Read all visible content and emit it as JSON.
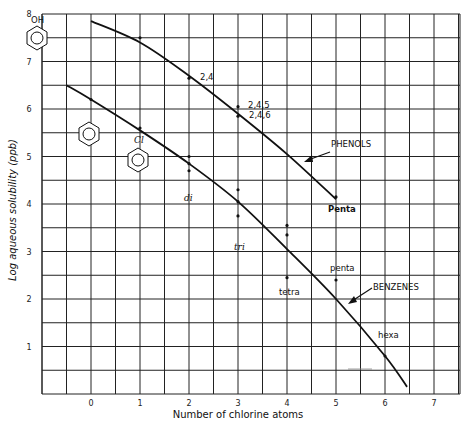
{
  "chart_data": {
    "type": "line",
    "title": "",
    "xlabel": "Number of chlorine atoms",
    "ylabel": "Log aqueous solubility (ppb)",
    "xlim": [
      -1,
      7.5
    ],
    "ylim": [
      0,
      8
    ],
    "x_ticks": [
      "0",
      "1",
      "2",
      "3",
      "4",
      "5",
      "6",
      "7"
    ],
    "y_ticks": [
      "1",
      "2",
      "3",
      "4",
      "5",
      "6",
      "7",
      "8"
    ],
    "grid": true,
    "series": [
      {
        "name": "PHENOLS",
        "curve": [
          [
            0,
            7.85
          ],
          [
            1,
            7.4
          ],
          [
            2,
            6.7
          ],
          [
            3,
            5.9
          ],
          [
            4,
            5.05
          ],
          [
            5,
            4.1
          ]
        ],
        "points": [
          {
            "x": 1,
            "y": 7.5,
            "label": ""
          },
          {
            "x": 2,
            "y": 6.65,
            "label": "2,4"
          },
          {
            "x": 3,
            "y": 6.05,
            "label": "2,4,5"
          },
          {
            "x": 3,
            "y": 5.85,
            "label": "2,4,6"
          },
          {
            "x": 5,
            "y": 4.15,
            "label": "Penta"
          }
        ]
      },
      {
        "name": "BENZENES",
        "curve": [
          [
            -0.5,
            6.5
          ],
          [
            0,
            6.2
          ],
          [
            1,
            5.55
          ],
          [
            2,
            4.85
          ],
          [
            3,
            4.05
          ],
          [
            4,
            3.05
          ],
          [
            5,
            2.0
          ],
          [
            6,
            0.8
          ],
          [
            6.45,
            0.15
          ]
        ],
        "points": [
          {
            "x": 0,
            "y": 6.2,
            "label": ""
          },
          {
            "x": 1,
            "y": 5.6,
            "label": ""
          },
          {
            "x": 2,
            "y": 5.0,
            "label": "di"
          },
          {
            "x": 2,
            "y": 4.85,
            "label": ""
          },
          {
            "x": 2,
            "y": 4.7,
            "label": ""
          },
          {
            "x": 3,
            "y": 4.3,
            "label": "tri"
          },
          {
            "x": 3,
            "y": 4.05,
            "label": ""
          },
          {
            "x": 3,
            "y": 3.75,
            "label": ""
          },
          {
            "x": 4,
            "y": 3.55,
            "label": "tetra"
          },
          {
            "x": 4,
            "y": 3.35,
            "label": ""
          },
          {
            "x": 4,
            "y": 2.45,
            "label": ""
          },
          {
            "x": 5,
            "y": 2.4,
            "label": "penta"
          },
          {
            "x": 6,
            "y": 0.8,
            "label": "hexa"
          }
        ]
      }
    ],
    "annotations": [
      {
        "text": "OH",
        "note": "phenol structure at top-left"
      },
      {
        "text": "Cl",
        "note": "chlorobenzene structure"
      },
      {
        "text": "PHENOLS",
        "note": "arrow to upper curve"
      },
      {
        "text": "BENZENES",
        "note": "arrow to lower curve"
      }
    ]
  },
  "labels": {
    "xlabel": "Number of chlorine atoms",
    "ylabel": "Log aqueous solubility (ppb)",
    "phenols": "PHENOLS",
    "benzenes": "BENZENES",
    "oh": "OH",
    "cl": "Cl",
    "p24": "2,4",
    "p245": "2,4,5",
    "p246": "2,4,6",
    "ppenta": "Penta",
    "bdi": "di",
    "btri": "tri",
    "btetra": "tetra",
    "bpenta": "penta",
    "bhexa": "hexa"
  }
}
